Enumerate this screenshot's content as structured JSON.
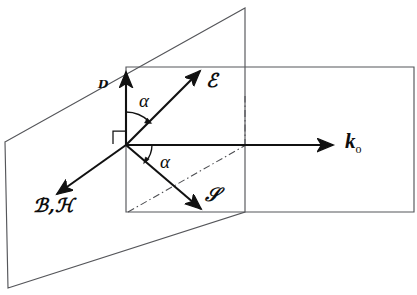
{
  "figure": {
    "background_color": "#ffffff",
    "width": 417,
    "height": 295,
    "line_color": "#55565a",
    "vector_color": "#111111",
    "aux_color": "#4c4d51"
  },
  "labels": {
    "d_vector": "ᴰ",
    "e_vector": "ℰ",
    "bh_vector": "ℬ,ℋ",
    "s_vector": "𝒮",
    "k_vector_base": "k",
    "k_vector_sub": "o",
    "angle_upper": "α",
    "angle_lower": "α"
  },
  "label_positions": {
    "d_vector": {
      "x": 98,
      "y": 78
    },
    "e_vector": {
      "x": 206,
      "y": 71
    },
    "bh_vector": {
      "x": 33,
      "y": 196
    },
    "s_vector": {
      "x": 205,
      "y": 185
    },
    "k_vector": {
      "x": 345,
      "y": 132
    },
    "angle_upper": {
      "x": 139,
      "y": 92
    },
    "angle_lower": {
      "x": 160,
      "y": 152
    }
  },
  "geometry": {
    "origin": {
      "x": 126,
      "y": 145
    },
    "slanted_plane": [
      {
        "x": 5,
        "y": 142
      },
      {
        "x": 126,
        "y": 67
      },
      {
        "x": 245,
        "y": 8
      },
      {
        "x": 245,
        "y": 8
      },
      {
        "x": 126,
        "y": 212
      },
      {
        "x": 8,
        "y": 288
      }
    ],
    "vertical_plane_points": "5,142 245,8 245,212 8,288",
    "horizontal_plane_points": "126,67 414,67 414,212 126,212",
    "vectors": [
      {
        "name": "D",
        "from": {
          "x": 126,
          "y": 145
        },
        "to": {
          "x": 126,
          "y": 68
        }
      },
      {
        "name": "E",
        "from": {
          "x": 126,
          "y": 145
        },
        "to": {
          "x": 203,
          "y": 68
        }
      },
      {
        "name": "BH",
        "from": {
          "x": 126,
          "y": 145
        },
        "to": {
          "x": 53,
          "y": 197
        }
      },
      {
        "name": "S",
        "from": {
          "x": 126,
          "y": 145
        },
        "to": {
          "x": 205,
          "y": 213
        }
      },
      {
        "name": "k0",
        "from": {
          "x": 126,
          "y": 145
        },
        "to": {
          "x": 338,
          "y": 145
        }
      }
    ],
    "aux_lines": [
      {
        "name": "diagonal-dashdot",
        "from": {
          "x": 128,
          "y": 212
        },
        "to": {
          "x": 245,
          "y": 145
        }
      },
      {
        "name": "vertical-dashdot",
        "from": {
          "x": 245,
          "y": 145
        },
        "to": {
          "x": 245,
          "y": 100
        }
      }
    ],
    "angle_arcs": [
      {
        "name": "angle-upper-arc",
        "center": {
          "x": 126,
          "y": 145
        },
        "radius": 33
      },
      {
        "name": "angle-lower-arc",
        "center": {
          "x": 126,
          "y": 145
        },
        "radius": 26
      }
    ],
    "right_angle_marker": {
      "x": 113,
      "y": 129,
      "size": 11
    }
  }
}
